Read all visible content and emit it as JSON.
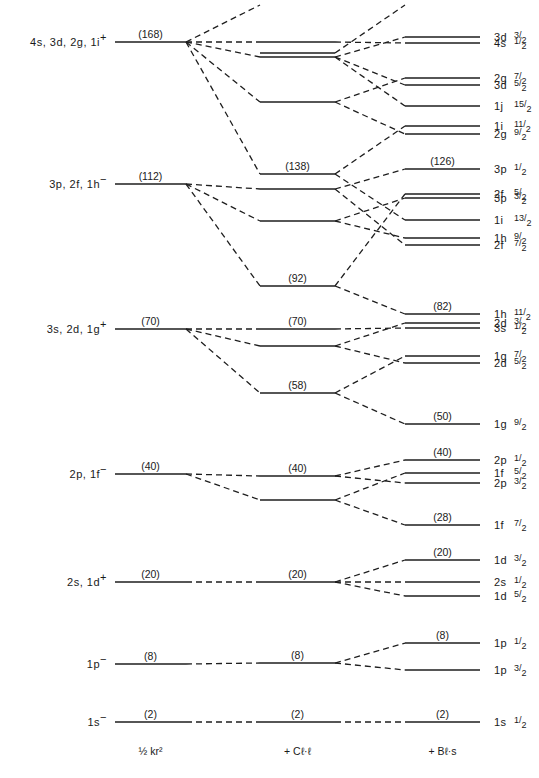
{
  "columns": [
    {
      "id": "ho",
      "label": "½ kr²",
      "x1": 115,
      "x2": 186
    },
    {
      "id": "ll",
      "label": "+ Cℓ·ℓ",
      "x1": 260,
      "x2": 335
    },
    {
      "id": "ls",
      "label": "+ Bℓ·s",
      "x1": 405,
      "x2": 480
    }
  ],
  "left_levels": [
    {
      "label": "4s, 3d, 2g, 1i",
      "parity": "+",
      "magic": "(168)",
      "y": 42
    },
    {
      "label": "3p, 2f, 1h",
      "parity": "−",
      "magic": "(112)",
      "y": 184
    },
    {
      "label": "3s, 2d, 1g",
      "parity": "+",
      "magic": "(70)",
      "y": 329
    },
    {
      "label": "2p, 1f",
      "parity": "−",
      "magic": "(40)",
      "y": 474
    },
    {
      "label": "2s, 1d",
      "parity": "+",
      "magic": "(20)",
      "y": 582
    },
    {
      "label": "1p",
      "parity": "−",
      "magic": "(8)",
      "y": 664
    },
    {
      "label": "1s",
      "parity": "−",
      "magic": "(2)",
      "y": 722
    }
  ],
  "middle_levels": [
    {
      "y": 42,
      "magic": ""
    },
    {
      "y": 53,
      "magic": ""
    },
    {
      "y": 57,
      "magic": ""
    },
    {
      "y": 102,
      "magic": ""
    },
    {
      "y": 174,
      "magic": "(138)"
    },
    {
      "y": 189,
      "magic": ""
    },
    {
      "y": 221,
      "magic": ""
    },
    {
      "y": 286,
      "magic": "(92)"
    },
    {
      "y": 329,
      "magic": "(70)"
    },
    {
      "y": 346,
      "magic": ""
    },
    {
      "y": 393,
      "magic": "(58)"
    },
    {
      "y": 476,
      "magic": "(40)"
    },
    {
      "y": 500,
      "magic": ""
    },
    {
      "y": 582,
      "magic": "(20)"
    },
    {
      "y": 663,
      "magic": "(8)"
    },
    {
      "y": 722,
      "magic": "(2)"
    }
  ],
  "right_levels": [
    {
      "orbital": "3d",
      "j": "3/2",
      "y": 37,
      "magic": ""
    },
    {
      "orbital": "4s",
      "j": "1/2",
      "y": 43,
      "magic": ""
    },
    {
      "orbital": "2g",
      "j": "7/2",
      "y": 78,
      "magic": ""
    },
    {
      "orbital": "3d",
      "j": "5/2",
      "y": 85,
      "magic": ""
    },
    {
      "orbital": "1j",
      "j": "15/2",
      "y": 106,
      "magic": ""
    },
    {
      "orbital": "1i",
      "j": "11/2",
      "y": 126,
      "magic": ""
    },
    {
      "orbital": "2g",
      "j": "9/2",
      "y": 134,
      "magic": ""
    },
    {
      "orbital": "3p",
      "j": "1/2",
      "y": 169,
      "magic": "(126)"
    },
    {
      "orbital": "2f",
      "j": "5/2",
      "y": 194,
      "magic": ""
    },
    {
      "orbital": "3p",
      "j": "3/2",
      "y": 198,
      "magic": ""
    },
    {
      "orbital": "1i",
      "j": "13/2",
      "y": 220,
      "magic": ""
    },
    {
      "orbital": "1h",
      "j": "9/2",
      "y": 238,
      "magic": ""
    },
    {
      "orbital": "2f",
      "j": "7/2",
      "y": 245,
      "magic": ""
    },
    {
      "orbital": "1h",
      "j": "11/2",
      "y": 314,
      "magic": "(82)"
    },
    {
      "orbital": "2d",
      "j": "3/2",
      "y": 323,
      "magic": ""
    },
    {
      "orbital": "3s",
      "j": "1/2",
      "y": 328,
      "magic": ""
    },
    {
      "orbital": "1g",
      "j": "7/2",
      "y": 356,
      "magic": ""
    },
    {
      "orbital": "2d",
      "j": "5/2",
      "y": 363,
      "magic": ""
    },
    {
      "orbital": "1g",
      "j": "9/2",
      "y": 424,
      "magic": "(50)"
    },
    {
      "orbital": "2p",
      "j": "1/2",
      "y": 460,
      "magic": "(40)"
    },
    {
      "orbital": "1f",
      "j": "5/2",
      "y": 473,
      "magic": ""
    },
    {
      "orbital": "2p",
      "j": "3/2",
      "y": 483,
      "magic": ""
    },
    {
      "orbital": "1f",
      "j": "7/2",
      "y": 525,
      "magic": "(28)"
    },
    {
      "orbital": "1d",
      "j": "3/2",
      "y": 560,
      "magic": "(20)"
    },
    {
      "orbital": "2s",
      "j": "1/2",
      "y": 582,
      "magic": ""
    },
    {
      "orbital": "1d",
      "j": "5/2",
      "y": 596,
      "magic": ""
    },
    {
      "orbital": "1p",
      "j": "1/2",
      "y": 643,
      "magic": "(8)"
    },
    {
      "orbital": "1p",
      "j": "3/2",
      "y": 670,
      "magic": ""
    },
    {
      "orbital": "1s",
      "j": "1/2",
      "y": 722,
      "magic": "(2)"
    }
  ],
  "left_to_middle": [
    [
      42,
      42
    ],
    [
      42,
      57
    ],
    [
      42,
      102
    ],
    [
      42,
      174
    ],
    [
      42,
      5
    ],
    [
      184,
      189
    ],
    [
      184,
      221
    ],
    [
      184,
      286
    ],
    [
      329,
      329
    ],
    [
      329,
      346
    ],
    [
      329,
      393
    ],
    [
      474,
      476
    ],
    [
      474,
      500
    ],
    [
      582,
      582
    ],
    [
      664,
      663
    ],
    [
      722,
      722
    ]
  ],
  "middle_to_right": [
    [
      42,
      43
    ],
    [
      57,
      37
    ],
    [
      57,
      85
    ],
    [
      57,
      106
    ],
    [
      53,
      5
    ],
    [
      102,
      78
    ],
    [
      102,
      134
    ],
    [
      174,
      126
    ],
    [
      174,
      220
    ],
    [
      189,
      169
    ],
    [
      189,
      245
    ],
    [
      221,
      198
    ],
    [
      221,
      238
    ],
    [
      286,
      194
    ],
    [
      286,
      314
    ],
    [
      329,
      328
    ],
    [
      346,
      323
    ],
    [
      346,
      363
    ],
    [
      393,
      356
    ],
    [
      393,
      424
    ],
    [
      476,
      460
    ],
    [
      476,
      483
    ],
    [
      500,
      473
    ],
    [
      500,
      525
    ],
    [
      582,
      560
    ],
    [
      582,
      582
    ],
    [
      582,
      596
    ],
    [
      663,
      643
    ],
    [
      663,
      670
    ],
    [
      722,
      722
    ]
  ]
}
